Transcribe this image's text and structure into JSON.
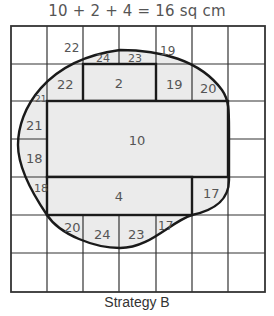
{
  "formula": "10 + 2 + 4 = 16 sq cm",
  "caption": "Strategy B",
  "colors": {
    "grid_line": "#333333",
    "outline": "#1a1a1a",
    "shade": "#ebebeb",
    "text": "#555555"
  },
  "grid": {
    "columns": 7,
    "rows": 7,
    "unit": "1 sq cm per square"
  },
  "rectangles": [
    {
      "label": "2",
      "area": 2,
      "col": 2,
      "row": 1,
      "width": 2,
      "height": 1
    },
    {
      "label": "10",
      "area": 10,
      "col": 1,
      "row": 2,
      "width": 5,
      "height": 2
    },
    {
      "label": "4",
      "area": 4,
      "col": 1,
      "row": 4,
      "width": 4,
      "height": 1
    }
  ],
  "partial_squares": [
    {
      "label": "22",
      "x": 64,
      "y": 52,
      "size": 12
    },
    {
      "label": "24",
      "x": 104,
      "y": 62,
      "size": 11
    },
    {
      "label": "23",
      "x": 136,
      "y": 62,
      "size": 11
    },
    {
      "label": "19",
      "x": 167,
      "y": 55,
      "size": 12
    },
    {
      "label": "22",
      "x": 65,
      "y": 88,
      "size": 13
    },
    {
      "label": "19",
      "x": 174,
      "y": 88,
      "size": 13
    },
    {
      "label": "20",
      "x": 210,
      "y": 92,
      "size": 13
    },
    {
      "label": "21",
      "x": 40,
      "y": 102,
      "size": 9
    },
    {
      "label": "21",
      "x": 33,
      "y": 130,
      "size": 13
    },
    {
      "label": "18",
      "x": 33,
      "y": 163,
      "size": 13
    },
    {
      "label": "18",
      "x": 40,
      "y": 192,
      "size": 11
    },
    {
      "label": "17",
      "x": 210,
      "y": 198,
      "size": 13
    },
    {
      "label": "20",
      "x": 73,
      "y": 232,
      "size": 13
    },
    {
      "label": "24",
      "x": 103,
      "y": 238,
      "size": 13
    },
    {
      "label": "23",
      "x": 137,
      "y": 238,
      "size": 13
    },
    {
      "label": "17",
      "x": 165,
      "y": 230,
      "size": 12
    }
  ]
}
